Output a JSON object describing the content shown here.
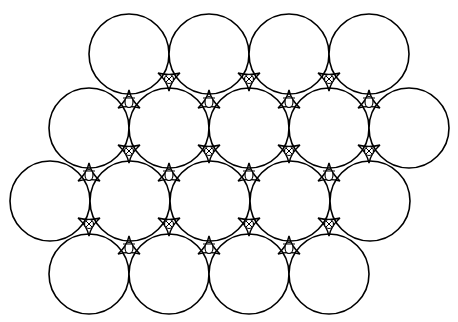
{
  "diagram": {
    "title": "",
    "stroke_color": "#000000",
    "background": "#ffffff",
    "radius": 40,
    "rows": [
      {
        "y": 54,
        "x": [
          129,
          209,
          289,
          369
        ]
      },
      {
        "y": 128,
        "x": [
          89,
          169,
          249,
          329,
          409
        ]
      },
      {
        "y": 201,
        "x": [
          50,
          130,
          210,
          290,
          370
        ]
      },
      {
        "y": 274,
        "x": [
          89,
          169,
          249,
          329
        ]
      }
    ],
    "interstitials": {
      "legend": [
        {
          "symbol": "crossed-circle",
          "meaning": "void pointing downward between rows (apex up)"
        },
        {
          "symbol": "oval",
          "meaning": "void pointing upward between rows (apex down)"
        }
      ],
      "crossed": [
        [
          169,
          78
        ],
        [
          249,
          78
        ],
        [
          329,
          78
        ],
        [
          129,
          150
        ],
        [
          209,
          150
        ],
        [
          289,
          150
        ],
        [
          369,
          150
        ],
        [
          89,
          223
        ],
        [
          169,
          223
        ],
        [
          249,
          223
        ],
        [
          329,
          223
        ]
      ],
      "oval": [
        [
          129,
          103
        ],
        [
          209,
          103
        ],
        [
          289,
          103
        ],
        [
          369,
          103
        ],
        [
          89,
          176
        ],
        [
          169,
          176
        ],
        [
          249,
          176
        ],
        [
          329,
          176
        ],
        [
          129,
          249
        ],
        [
          209,
          249
        ],
        [
          289,
          249
        ]
      ]
    }
  }
}
